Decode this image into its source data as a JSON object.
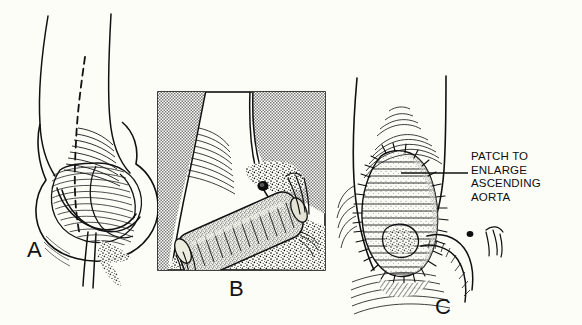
{
  "figure": {
    "background_color": "#fdfdf8",
    "ink_color": "#111111",
    "width": 582,
    "height": 325
  },
  "panels": [
    {
      "id": "a",
      "letter": "A",
      "caption": "Aortic root and ascending aorta with dashed incision line extending into the noncoronary sinus",
      "features": [
        "ascending-aorta-outline",
        "aortic-root-sinuses",
        "coronary-artery",
        "dashed-incision-line",
        "stipple-shading"
      ]
    },
    {
      "id": "b",
      "letter": "B",
      "caption": "Framed inset: cross-sectional view of the conduit/graft seated at the aortic root within hatched tissue planes",
      "features": [
        "inset-frame",
        "hatched-field-left",
        "hatched-field-right",
        "tubular-graft",
        "stipple-field",
        "suture-tails"
      ]
    },
    {
      "id": "c",
      "letter": "C",
      "caption": "Completed repair: teardrop-shaped patch sutured into the aortotomy to enlarge the ascending aorta",
      "features": [
        "ascending-aorta-outline",
        "teardrop-patch",
        "running-suture-line",
        "coronary-artery",
        "leader-line",
        "annotation-text"
      ]
    }
  ],
  "annotations": {
    "patch_label": {
      "lines": [
        "PATCH TO",
        "ENLARGE",
        "ASCENDING",
        "AORTA"
      ],
      "line1": "PATCH TO",
      "line2": "ENLARGE",
      "line3": "ASCENDING",
      "line4": "AORTA",
      "leader_line": true,
      "points_to": "teardrop-patch"
    }
  },
  "labels": {
    "panel_a": "A",
    "panel_b": "B",
    "panel_c": "C"
  }
}
